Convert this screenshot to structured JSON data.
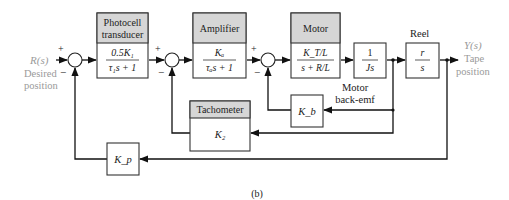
{
  "figure": {
    "caption": "(b)",
    "input": {
      "symbol": "R(s)",
      "label_line1": "Desired",
      "label_line2": "position"
    },
    "output": {
      "symbol": "Y(s)",
      "label_line1": "Tape",
      "label_line2": "position"
    },
    "summing_junctions": [
      {
        "id": "sum1",
        "plus": "+",
        "minus": "−"
      },
      {
        "id": "sum2",
        "plus": "+",
        "minus": "−"
      },
      {
        "id": "sum3",
        "plus": "+",
        "minus": "−"
      }
    ],
    "blocks": {
      "photocell": {
        "header_line1": "Photocell",
        "header_line2": "transducer",
        "num": "0.5K₁",
        "den": "τ₁s + 1"
      },
      "amplifier": {
        "header": "Amplifier",
        "num": "Kₐ",
        "den": "τₐs + 1"
      },
      "motor": {
        "header": "Motor",
        "num": "K_T/L",
        "den": "s + R/L"
      },
      "inertia": {
        "num": "1",
        "den": "Js"
      },
      "reel": {
        "label": "Reel",
        "num": "r",
        "den": "s"
      },
      "back_emf": {
        "gain": "K_b",
        "label_line1": "Motor",
        "label_line2": "back-emf"
      },
      "tachometer": {
        "header": "Tachometer",
        "gain": "K₂"
      },
      "position_feedback": {
        "gain": "K_p"
      }
    }
  }
}
